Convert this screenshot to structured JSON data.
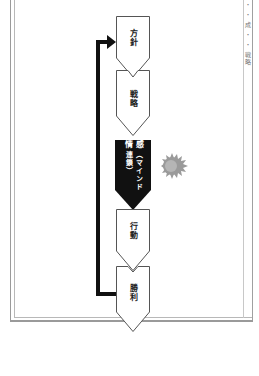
{
  "diagram": {
    "type": "vertical-chevron-flow",
    "orientation_note": "text rotated 90deg, flow top to bottom",
    "steps": [
      {
        "label": "方針",
        "style": "outline"
      },
      {
        "label": "戦略",
        "style": "outline"
      },
      {
        "label": "感情",
        "sublabel": "（マインド連鎖）",
        "style": "filled-dark"
      },
      {
        "label": "行動",
        "style": "outline"
      },
      {
        "label": "勝利",
        "style": "outline"
      }
    ],
    "feedback_loop": {
      "from": "勝利",
      "to": "方針"
    },
    "decoration": "flame-burst-icon",
    "edge_text": "・ ・ 成 ・ ・ 戦略"
  },
  "colors": {
    "box_outline": "#555555",
    "box_dark_fill": "#111111",
    "arrow": "#111111",
    "flame": "#9a9a9a",
    "frame": "#9a9a9a"
  }
}
